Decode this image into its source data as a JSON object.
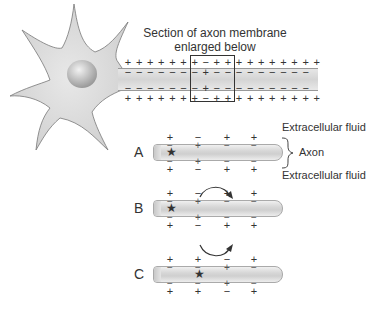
{
  "title": "Section of axon membrane enlarged below",
  "caption_line1": "Section of axon membrane",
  "caption_line2": "enlarged below",
  "top_axon": {
    "outer_top": "+ + + + + + + − + + + + + + + + + +",
    "inner_top": "− − − − − − − + − − − − − − − − −",
    "inner_bottom": "− − − − − − − + − − − − − − − − −",
    "outer_bottom": "+ + + + + + + − + + + + + + + + + +"
  },
  "labels": {
    "extracellular_top": "Extracellular fluid",
    "axon": "Axon",
    "extracellular_bottom": "Extracellular fluid",
    "brace": "}"
  },
  "rows": [
    {
      "label": "A",
      "outer": [
        "+",
        "−",
        "+",
        "+"
      ],
      "inner_top": [
        "−",
        "+",
        "−",
        "−"
      ],
      "inner_bottom": [
        "−",
        "+",
        "−",
        "−"
      ],
      "outer_bottom": [
        "+",
        "−",
        "+",
        "+"
      ],
      "star_position": 0
    },
    {
      "label": "B",
      "outer": [
        "+",
        "−",
        "+",
        "+"
      ],
      "inner_top": [
        "−",
        "+",
        "−",
        "−"
      ],
      "inner_bottom": [
        "−",
        "+",
        "−",
        "−"
      ],
      "outer_bottom": [
        "+",
        "−",
        "+",
        "+"
      ],
      "star_position": 0,
      "arrows": true
    },
    {
      "label": "C",
      "outer": [
        "+",
        "+",
        "−",
        "+"
      ],
      "inner_top": [
        "−",
        "−",
        "+",
        "−"
      ],
      "inner_bottom": [
        "−",
        "−",
        "+",
        "−"
      ],
      "outer_bottom": [
        "+",
        "+",
        "−",
        "+"
      ],
      "star_position": 1
    }
  ],
  "star": "★"
}
